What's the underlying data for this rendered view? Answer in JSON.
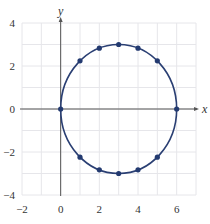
{
  "chart_data": {
    "type": "scatter",
    "title": "",
    "xlabel": "x",
    "ylabel": "y",
    "xlim": [
      -2,
      7
    ],
    "ylim": [
      -4,
      4
    ],
    "grid": true,
    "grid_step_x": 1,
    "grid_step_y": 1,
    "x_ticks": [
      -2,
      0,
      2,
      4,
      6
    ],
    "x_tick_labels": [
      "−2",
      "0",
      "2",
      "4",
      "6"
    ],
    "y_ticks": [
      -4,
      -2,
      0,
      2,
      4
    ],
    "y_tick_labels": [
      "−4",
      "−2",
      "0",
      "2",
      "4"
    ],
    "curve": {
      "description": "circle (x-3)^2 + y^2 = 9",
      "center": [
        3,
        0
      ],
      "radius_x": 3,
      "radius_y": 3
    },
    "series": [
      {
        "name": "points",
        "points": [
          [
            0,
            0
          ],
          [
            1,
            2.24
          ],
          [
            2,
            2.83
          ],
          [
            3,
            3
          ],
          [
            4,
            2.83
          ],
          [
            5,
            2.24
          ],
          [
            6,
            0
          ],
          [
            5,
            -2.24
          ],
          [
            4,
            -2.83
          ],
          [
            3,
            -3
          ],
          [
            2,
            -2.83
          ],
          [
            1,
            -2.24
          ]
        ]
      }
    ],
    "colors": {
      "curve": "#2a3f73",
      "points": "#233a70",
      "grid": "#e6e6ea",
      "axis": "#555555"
    }
  }
}
